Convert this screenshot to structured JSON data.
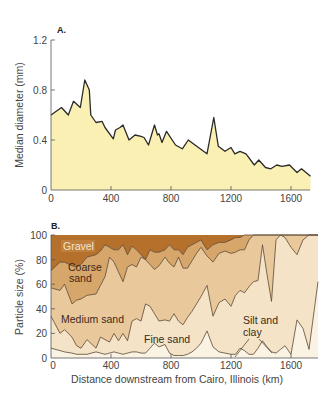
{
  "chart_data": [
    {
      "panel": "A.",
      "type": "area",
      "title": "",
      "xlabel": "",
      "ylabel": "Median diameter (mm)",
      "xlim": [
        0,
        1730
      ],
      "ylim": [
        0,
        1.2
      ],
      "xticks": [
        0,
        400,
        800,
        1200,
        1600
      ],
      "yticks": [
        0,
        0.4,
        0.8,
        1.2
      ],
      "ytick_labels": [
        "0",
        "0.4",
        "0.8",
        "1.2"
      ],
      "grid": false,
      "fill_color": "#fbf0b4",
      "line_color": "#2a2a2a",
      "x": [
        0,
        70,
        115,
        150,
        195,
        225,
        255,
        265,
        300,
        340,
        360,
        415,
        430,
        460,
        480,
        520,
        560,
        600,
        620,
        650,
        690,
        710,
        720,
        740,
        770,
        830,
        875,
        915,
        960,
        1040,
        1085,
        1115,
        1160,
        1200,
        1225,
        1260,
        1300,
        1355,
        1385,
        1430,
        1465,
        1505,
        1540,
        1590,
        1640,
        1670,
        1700,
        1730
      ],
      "values": [
        0.6,
        0.66,
        0.6,
        0.71,
        0.66,
        0.88,
        0.8,
        0.6,
        0.54,
        0.55,
        0.5,
        0.41,
        0.48,
        0.5,
        0.52,
        0.4,
        0.44,
        0.43,
        0.42,
        0.36,
        0.52,
        0.44,
        0.45,
        0.38,
        0.47,
        0.36,
        0.33,
        0.4,
        0.36,
        0.29,
        0.58,
        0.35,
        0.31,
        0.34,
        0.29,
        0.31,
        0.29,
        0.2,
        0.24,
        0.18,
        0.17,
        0.2,
        0.19,
        0.2,
        0.14,
        0.17,
        0.14,
        0.11
      ]
    },
    {
      "panel": "B.",
      "type": "area",
      "stacked": true,
      "title": "",
      "xlabel": "Distance downstream from Cairo, Illinois (km)",
      "ylabel": "Particle size (%)",
      "xlim": [
        0,
        1780
      ],
      "ylim": [
        0,
        100
      ],
      "xticks": [
        0,
        400,
        800,
        1200,
        1600
      ],
      "yticks": [
        0,
        20,
        40,
        60,
        80,
        100
      ],
      "grid": false,
      "description": "Cumulative boundary lines (% finer than class top), from bottom to top: Silt and clay, Fine sand, Medium sand, Coarse sand, Gravel (fills to 100%).",
      "x": [
        0,
        60,
        90,
        140,
        170,
        200,
        240,
        300,
        330,
        360,
        390,
        420,
        450,
        480,
        510,
        540,
        570,
        600,
        630,
        660,
        690,
        720,
        760,
        790,
        820,
        850,
        880,
        910,
        940,
        970,
        1000,
        1040,
        1080,
        1120,
        1160,
        1200,
        1230,
        1260,
        1290,
        1320,
        1350,
        1380,
        1410,
        1440,
        1470,
        1500,
        1530,
        1560,
        1600,
        1640,
        1680,
        1720,
        1780
      ],
      "series": [
        {
          "name": "Silt and clay",
          "color": "#faf3e4",
          "upper": [
            8,
            6,
            5,
            4,
            3,
            3,
            3,
            5,
            4,
            3,
            4,
            5,
            4,
            3,
            4,
            5,
            5,
            4,
            4,
            8,
            12,
            9,
            11,
            4,
            2,
            2,
            2,
            3,
            5,
            8,
            12,
            22,
            9,
            5,
            4,
            3,
            3,
            8,
            6,
            3,
            3,
            8,
            14,
            9,
            5,
            4,
            7,
            10,
            3,
            31,
            24,
            7,
            62
          ]
        },
        {
          "name": "Fine sand",
          "color": "#f4e3c6",
          "upper": [
            34,
            20,
            23,
            17,
            10,
            8,
            15,
            8,
            17,
            15,
            13,
            20,
            14,
            20,
            14,
            30,
            32,
            30,
            44,
            42,
            36,
            30,
            31,
            30,
            36,
            30,
            27,
            33,
            38,
            44,
            50,
            59,
            34,
            45,
            48,
            42,
            51,
            55,
            53,
            58,
            62,
            63,
            92,
            68,
            46,
            96,
            100,
            98,
            90,
            84,
            96,
            100,
            100
          ]
        },
        {
          "name": "Medium sand",
          "color": "#e9c99c",
          "upper": [
            57,
            55,
            60,
            44,
            47,
            48,
            51,
            52,
            59,
            66,
            82,
            78,
            70,
            62,
            74,
            76,
            74,
            82,
            80,
            76,
            72,
            75,
            82,
            77,
            74,
            82,
            73,
            73,
            79,
            85,
            90,
            83,
            78,
            85,
            87,
            85,
            86,
            88,
            88,
            96,
            100,
            100,
            100,
            100,
            100,
            100,
            100,
            100,
            100,
            100,
            100,
            100,
            100
          ]
        },
        {
          "name": "Coarse sand",
          "color": "#d7a66a",
          "upper": [
            71,
            78,
            78,
            75,
            74,
            76,
            82,
            84,
            87,
            92,
            90,
            88,
            88,
            92,
            84,
            91,
            88,
            84,
            80,
            88,
            86,
            86,
            88,
            92,
            88,
            88,
            84,
            90,
            92,
            94,
            96,
            88,
            92,
            94,
            94,
            96,
            98,
            98,
            100,
            100,
            100,
            100,
            100,
            100,
            100,
            100,
            100,
            100,
            100,
            100,
            100,
            100,
            100
          ]
        },
        {
          "name": "Gravel",
          "color": "#b5702c",
          "upper": [
            100,
            100,
            100,
            100,
            100,
            100,
            100,
            100,
            100,
            100,
            100,
            100,
            100,
            100,
            100,
            100,
            100,
            100,
            100,
            100,
            100,
            100,
            100,
            100,
            100,
            100,
            100,
            100,
            100,
            100,
            100,
            100,
            100,
            100,
            100,
            100,
            100,
            100,
            100,
            100,
            100,
            100,
            100,
            100,
            100,
            100,
            100,
            100,
            100,
            100,
            100,
            100,
            100
          ]
        }
      ],
      "annotations": [
        {
          "text": "Gravel",
          "x": 75,
          "y": 92
        },
        {
          "text": "Coarse",
          "x": 115,
          "y": 68
        },
        {
          "text": "sand",
          "x": 120,
          "y": 59
        },
        {
          "text": "Medium sand",
          "x": 70,
          "y": 36
        },
        {
          "text": "Fine sand",
          "x": 640,
          "y": 17
        },
        {
          "text": "Silt and",
          "x": 1300,
          "y": 36
        },
        {
          "text": "clay",
          "x": 1300,
          "y": 26
        }
      ]
    }
  ],
  "panels": {
    "a": {
      "label": "A.",
      "ylabel": "Median diameter (mm)",
      "yticks": [
        "0",
        "0.4",
        "0.8",
        "1.2"
      ],
      "xticks": [
        "0",
        "400",
        "800",
        "1200",
        "1600"
      ]
    },
    "b": {
      "label": "B.",
      "ylabel": "Particle size (%)",
      "xlabel": "Distance downstream from Cairo, Illinois (km)",
      "yticks": [
        "0",
        "20",
        "40",
        "60",
        "80",
        "100"
      ],
      "xticks": [
        "0",
        "400",
        "800",
        "1200",
        "1600"
      ],
      "labels": {
        "gravel": "Gravel",
        "coarse1": "Coarse",
        "coarse2": "sand",
        "medium": "Medium sand",
        "fine": "Fine sand",
        "silt1": "Silt and",
        "silt2": "clay"
      }
    }
  }
}
